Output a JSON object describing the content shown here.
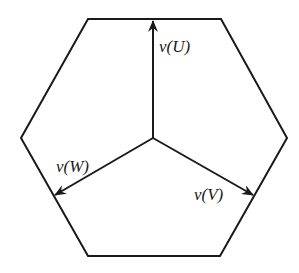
{
  "diagram": {
    "type": "space-vector-hexagon",
    "colors": {
      "stroke": "#1a1a1a",
      "background": "#ffffff"
    },
    "hexagon": {
      "vertices": [
        [
          88,
          19
        ],
        [
          221,
          19
        ],
        [
          287,
          138
        ],
        [
          220,
          256
        ],
        [
          88,
          256
        ],
        [
          21,
          138
        ]
      ]
    },
    "origin": [
      153,
      138
    ],
    "vectors": [
      {
        "id": "U",
        "label": "v(U)",
        "tip": [
          153,
          21
        ],
        "label_pos": [
          159,
          52
        ]
      },
      {
        "id": "V",
        "label": "v(V)",
        "tip": [
          253,
          195
        ],
        "label_pos": [
          194,
          200
        ]
      },
      {
        "id": "W",
        "label": "v(W)",
        "tip": [
          55,
          195
        ],
        "label_pos": [
          56,
          172
        ]
      }
    ]
  }
}
